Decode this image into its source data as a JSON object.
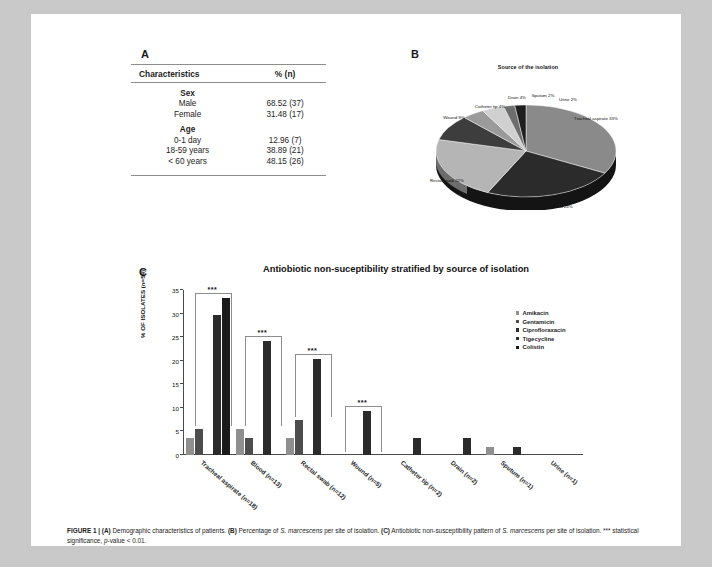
{
  "panels": {
    "a_letter": "A",
    "b_letter": "B",
    "c_letter": "C"
  },
  "table": {
    "headers": [
      "Characteristics",
      "% (n)"
    ],
    "groups": [
      {
        "title": "Sex",
        "rows": [
          {
            "label": "Male",
            "value": "68.52 (37)"
          },
          {
            "label": "Female",
            "value": "31.48 (17)"
          }
        ]
      },
      {
        "title": "Age",
        "rows": [
          {
            "label": "0-1 day",
            "value": "12.96 (7)"
          },
          {
            "label": "18-59 years",
            "value": "38.89 (21)"
          },
          {
            "label": "< 60 years",
            "value": "48.15 (26)"
          }
        ]
      }
    ]
  },
  "chart_data": [
    {
      "type": "pie",
      "title": "Source of the isolation",
      "categories": [
        "Tracheal aspirate",
        "Blood",
        "Rectal swab",
        "Wound",
        "Catheter tip",
        "Drain",
        "Sputum",
        "Urine"
      ],
      "values": [
        33,
        24,
        22,
        9,
        4,
        4,
        2,
        2
      ],
      "labels": [
        "Tracheal aspirate 33%",
        "Blood 24%",
        "Rectal swab 22%",
        "Wound 9%",
        "Catheter tip 4%",
        "Drain 4%",
        "Sputum 2%",
        "Urine 2%"
      ],
      "legend": "labels-on-slices",
      "colors": [
        "#8a8a8a",
        "#2b2b2b",
        "#b5b5b5",
        "#3d3d3d",
        "#9a9a9a",
        "#d0d0d0",
        "#6e6e6e",
        "#1e1e1e"
      ]
    },
    {
      "type": "bar",
      "title": "Antiobiotic non-suceptibility stratified by source of isolation",
      "ylabel": "% OF ISOLATES (n=54)",
      "xlabel": "",
      "ylim": [
        0,
        35
      ],
      "yticks": [
        0,
        5,
        10,
        15,
        20,
        25,
        30,
        35
      ],
      "grid": false,
      "legend_position": "right",
      "categories": [
        "Tracheal aspirate (n=18)",
        "Blood (n=13)",
        "Rectal swab (n=12)",
        "Wound (n=5)",
        "Catheter tip (n=2)",
        "Drain (n=2)",
        "Sputum (n=1)",
        "Urine (n=1)"
      ],
      "series": [
        {
          "name": "Amikacin",
          "color": "#8f8f8f",
          "values": [
            3.7,
            5.5,
            3.7,
            0.0,
            0.0,
            0.0,
            1.8,
            0.0
          ]
        },
        {
          "name": "Gentamicin",
          "color": "#4d4d4d",
          "values": [
            5.5,
            3.7,
            7.4,
            0.0,
            0.0,
            0.0,
            0.0,
            0.0
          ]
        },
        {
          "name": "Ciprofloraxacin",
          "color": "#2b2b2b",
          "values": [
            0.0,
            0.0,
            0.0,
            0.0,
            0.0,
            0.0,
            0.0,
            0.0
          ]
        },
        {
          "name": "Tigecycline",
          "color": "#2b2b2b",
          "values": [
            29.6,
            24.1,
            20.4,
            9.3,
            3.7,
            3.7,
            1.8,
            0.0
          ]
        },
        {
          "name": "Colistin",
          "color": "#1a1a1a",
          "values": [
            33.3,
            0.0,
            0.0,
            0.0,
            0.0,
            0.0,
            0.0,
            0.0
          ]
        }
      ],
      "annotations": [
        {
          "text": "***",
          "category": "Tracheal aspirate (n=18)"
        },
        {
          "text": "***",
          "category": "Blood (n=13)"
        },
        {
          "text": "***",
          "category": "Rectal swab (n=12)"
        },
        {
          "text": "***",
          "category": "Wound (n=5)"
        }
      ]
    }
  ],
  "caption": {
    "figure_label": "FIGURE 1 |",
    "a_tag": "(A)",
    "a_text": " Demographic characteristics of patients. ",
    "b_tag": "(B)",
    "b_text_1": " Percentage of ",
    "b_italic": "S. marcescens",
    "b_text_2": " per site of isolation. ",
    "c_tag": "(C)",
    "c_text_1": " Antiobiotic non-susceptibility pattern of ",
    "c_italic": "S. marcescens",
    "c_text_2": " per site of isolation. *** statistical significance, ",
    "c_italic_2": "p",
    "c_text_3": "-value < 0.01."
  }
}
